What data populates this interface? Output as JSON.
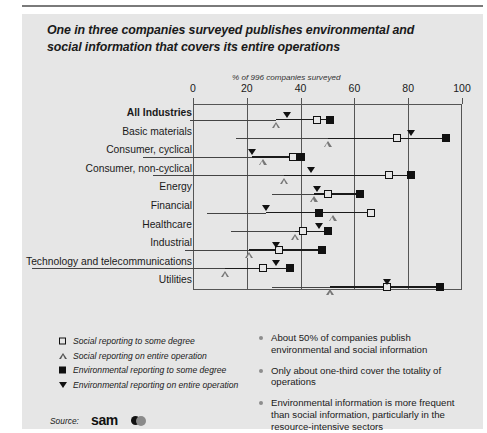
{
  "title": "One in three companies surveyed publishes environmental and social information that covers its entire operations",
  "subtitle": "% of 996 companies surveyed",
  "source": {
    "label": "Source:",
    "logo": "sam"
  },
  "legend": [
    {
      "icon": "open-square",
      "label": "Social reporting to some degree"
    },
    {
      "icon": "triangle-up",
      "label": "Social reporting on entire operation"
    },
    {
      "icon": "filled-square",
      "label": "Environmental reporting to some degree"
    },
    {
      "icon": "triangle-down",
      "label": "Environmental reporting on entire operation"
    }
  ],
  "bullets": [
    "About 50% of companies publish environmental and social information",
    "Only about one-third cover the totality of operations",
    "Environmental information is more frequent than social information, particularly in the resource-intensive sectors"
  ],
  "chart_data": {
    "type": "scatter",
    "title": "One in three companies surveyed publishes environmental and social information that covers its entire operations",
    "subtitle": "% of 996 companies surveyed",
    "xlabel": "% of 996 companies surveyed",
    "ylabel": "",
    "xlim": [
      0,
      100
    ],
    "xticks": [
      0,
      20,
      40,
      60,
      80,
      100
    ],
    "grid": true,
    "legend_position": "below-left",
    "categories": [
      "All industries",
      "Basic materials",
      "Consumer, cyclical",
      "Consumer, non-cyclical",
      "Energy",
      "Financial",
      "Healthcare",
      "Industrial",
      "Technology and telecommunications",
      "Utilities"
    ],
    "series": [
      {
        "name": "Social reporting to some degree",
        "marker": "open-square",
        "values": [
          46,
          76,
          37,
          73,
          50,
          66,
          41,
          32,
          26,
          72
        ]
      },
      {
        "name": "Social reporting on entire operation",
        "marker": "triangle-up",
        "values": [
          31,
          50,
          26,
          34,
          45,
          52,
          38,
          21,
          12,
          51
        ]
      },
      {
        "name": "Environmental reporting to some degree",
        "marker": "filled-square",
        "values": [
          51,
          94,
          40,
          81,
          62,
          47,
          50,
          48,
          36,
          92
        ]
      },
      {
        "name": "Environmental reporting on entire operation",
        "marker": "triangle-down",
        "values": [
          35,
          81,
          22,
          44,
          46,
          27,
          47,
          31,
          31,
          72
        ]
      }
    ]
  },
  "rows": [
    {
      "label": "All industries",
      "display_label": "All Industries",
      "bold": true
    },
    {
      "label": "Basic materials",
      "display_label": "Basic materials",
      "bold": false
    },
    {
      "label": "Consumer, cyclical",
      "display_label": "Consumer, cyclical",
      "bold": false
    },
    {
      "label": "Consumer, non-cyclical",
      "display_label": "Consumer, non-cyclical",
      "bold": false
    },
    {
      "label": "Energy",
      "display_label": "Energy",
      "bold": false
    },
    {
      "label": "Financial",
      "display_label": "Financial",
      "bold": false
    },
    {
      "label": "Healthcare",
      "display_label": "Healthcare",
      "bold": false
    },
    {
      "label": "Industrial",
      "display_label": "Industrial",
      "bold": false
    },
    {
      "label": "Technology and telecommunications",
      "display_label": "Technology and telecommunications",
      "bold": false
    },
    {
      "label": "Utilities",
      "display_label": "Utilities",
      "bold": false
    }
  ]
}
